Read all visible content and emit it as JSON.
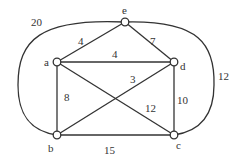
{
  "graph": {
    "nodes": [
      {
        "id": "e",
        "label": "e",
        "x": 125,
        "y": 22,
        "lx": 122,
        "ly": 14
      },
      {
        "id": "a",
        "label": "a",
        "x": 57,
        "y": 62,
        "lx": 44,
        "ly": 66
      },
      {
        "id": "d",
        "label": "d",
        "x": 174,
        "y": 62,
        "lx": 180,
        "ly": 70
      },
      {
        "id": "b",
        "label": "b",
        "x": 57,
        "y": 135,
        "lx": 48,
        "ly": 152
      },
      {
        "id": "c",
        "label": "c",
        "x": 174,
        "y": 135,
        "lx": 176,
        "ly": 149
      }
    ],
    "edges": [
      {
        "from": "e",
        "to": "a",
        "weight": "4",
        "lx": 78,
        "ly": 45
      },
      {
        "from": "e",
        "to": "d",
        "weight": "7",
        "lx": 150,
        "ly": 45
      },
      {
        "from": "a",
        "to": "d",
        "weight": "4",
        "lx": 112,
        "ly": 58
      },
      {
        "from": "a",
        "to": "b",
        "weight": "8",
        "lx": 64,
        "ly": 101
      },
      {
        "from": "a",
        "to": "c",
        "weight": "12",
        "lx": 145,
        "ly": 112
      },
      {
        "from": "d",
        "to": "b",
        "weight": "3",
        "lx": 130,
        "ly": 83
      },
      {
        "from": "d",
        "to": "c",
        "weight": "10",
        "lx": 177,
        "ly": 104
      },
      {
        "from": "b",
        "to": "c",
        "weight": "15",
        "lx": 104,
        "ly": 154
      },
      {
        "from": "e",
        "to": "b",
        "weight": "20",
        "curved": true,
        "lx": 31,
        "ly": 26
      },
      {
        "from": "e",
        "to": "c",
        "weight": "12",
        "curved": true,
        "lx": 218,
        "ly": 80
      }
    ]
  }
}
